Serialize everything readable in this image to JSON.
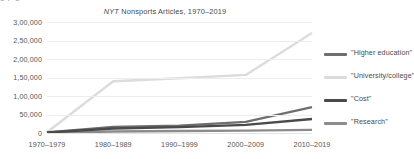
{
  "clipped_top_text": "g                    p                                   g",
  "chart_data": {
    "type": "line",
    "title_italic_prefix": "NYT",
    "title_rest": " Nonsports Articles, 1970–2019",
    "title_full": "NYT Nonsports Articles, 1970–2019",
    "xlabel": "",
    "ylabel": "",
    "grid": true,
    "legend_position": "right",
    "ylim": [
      0,
      300000
    ],
    "ytick_values": [
      300000,
      250000,
      200000,
      150000,
      100000,
      50000,
      0
    ],
    "ytick_labels": [
      "3,00,000",
      "2,50,000",
      "2,00,000",
      "1,50,000",
      "1,00,000",
      "50,000",
      "0"
    ],
    "categories": [
      "1970–1979",
      "1980–1989",
      "1990–1999",
      "2000–2009",
      "2010–2019"
    ],
    "series": [
      {
        "name": "\"Higher education\"",
        "color": "#6e6e6e",
        "values": [
          1500,
          16500,
          20000,
          30000,
          70000
        ]
      },
      {
        "name": "\"University/college\"",
        "color": "#dcdcdc",
        "values": [
          2000,
          140000,
          148000,
          157000,
          270000
        ]
      },
      {
        "name": "\"Cost\"",
        "color": "#4a4a4a",
        "values": [
          1200,
          12000,
          16000,
          22000,
          38000
        ]
      },
      {
        "name": "\"Research\"",
        "color": "#8c8c8c",
        "values": [
          800,
          4000,
          5500,
          6500,
          8500
        ]
      }
    ]
  },
  "legend": {
    "items": [
      {
        "label": "\"Higher education\"",
        "color": "#6e6e6e"
      },
      {
        "label": "\"University/college\"",
        "color": "#dcdcdc"
      },
      {
        "label": "\"Cost\"",
        "color": "#4a4a4a"
      },
      {
        "label": "\"Research\"",
        "color": "#8c8c8c"
      }
    ]
  }
}
